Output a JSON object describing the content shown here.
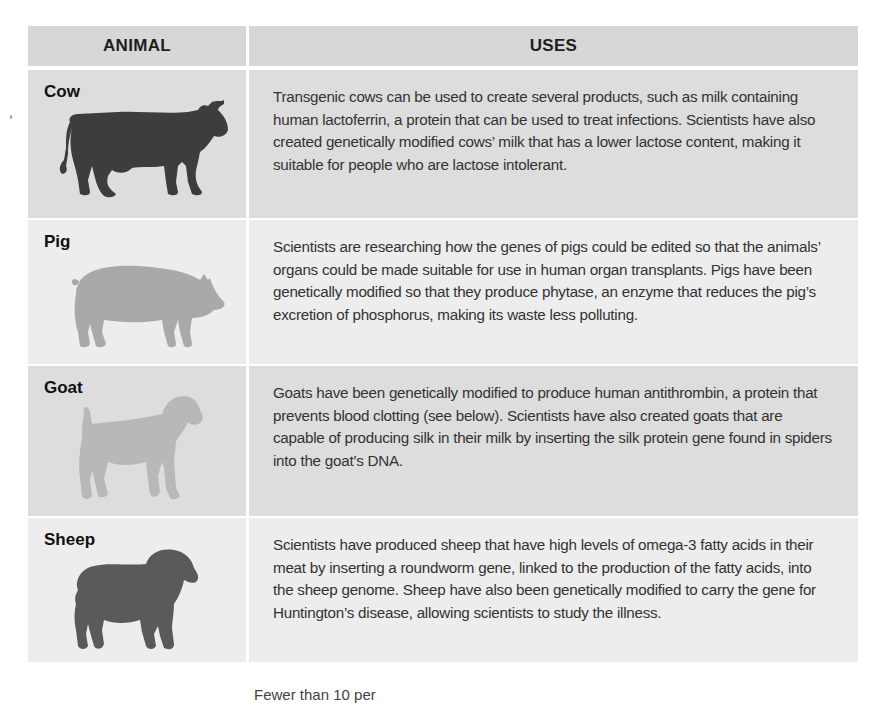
{
  "stray_mark": ",",
  "table": {
    "headers": {
      "animal": "ANIMAL",
      "uses": "USES"
    },
    "rows": [
      {
        "animal": "Cow",
        "icon": "cow-silhouette",
        "icon_color": "#3d3d3d",
        "uses": "Transgenic cows can be used to create several products, such as milk containing human lactoferrin, a protein that can be used to treat infections. Scientists have also created genetically modified cows’ milk that has a lower lactose content, making it suitable for people who are lactose intolerant."
      },
      {
        "animal": "Pig",
        "icon": "pig-silhouette",
        "icon_color": "#a9a9a9",
        "uses": "Scientists are researching how the genes of pigs could be edited so that the animals’ organs could be made suitable for use in human organ transplants. Pigs have been genetically modified so that they produce phytase, an enzyme that reduces the pig’s excretion of phosphorus, making its waste less polluting."
      },
      {
        "animal": "Goat",
        "icon": "goat-silhouette",
        "icon_color": "#b8b8b8",
        "uses": "Goats have been genetically modified to produce human antithrombin, a protein that prevents blood clotting (see below). Scientists have also created goats that are capable of producing silk in their milk by inserting the silk protein gene found in spiders into the goat’s DNA."
      },
      {
        "animal": "Sheep",
        "icon": "sheep-silhouette",
        "icon_color": "#5a5a5a",
        "uses": "Scientists have produced sheep that have high levels of omega-3 fatty acids in their meat by inserting a roundworm gene, linked to the production of the fatty acids, into the sheep genome. Sheep have also been genetically modified to carry the gene for Huntington’s disease, allowing scientists to study the illness."
      }
    ]
  },
  "footer_text": "Fewer than 10 per"
}
